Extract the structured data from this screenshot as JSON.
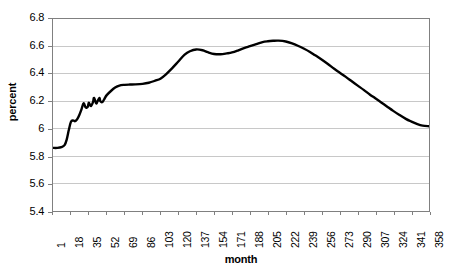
{
  "chart_data": {
    "type": "line",
    "title": "",
    "xlabel": "month",
    "ylabel": "percent",
    "xlim": [
      1,
      358
    ],
    "ylim": [
      5.4,
      6.8
    ],
    "grid": true,
    "legend": null,
    "y_ticks": [
      "6.8",
      "6.6",
      "6.4",
      "6.2",
      "6",
      "5.8",
      "5.6",
      "5.4"
    ],
    "y_tick_values": [
      6.8,
      6.6,
      6.4,
      6.2,
      6.0,
      5.8,
      5.6,
      5.4
    ],
    "x_ticks": [
      "1",
      "18",
      "35",
      "52",
      "69",
      "86",
      "103",
      "120",
      "137",
      "154",
      "171",
      "188",
      "205",
      "222",
      "239",
      "256",
      "273",
      "290",
      "307",
      "324",
      "341",
      "358"
    ],
    "x_tick_values": [
      1,
      18,
      35,
      52,
      69,
      86,
      103,
      120,
      137,
      154,
      171,
      188,
      205,
      222,
      239,
      256,
      273,
      290,
      307,
      324,
      341,
      358
    ],
    "series": [
      {
        "name": "percent",
        "color": "#000000",
        "line_width": 2.4,
        "x": [
          1,
          5,
          9,
          12,
          14,
          16,
          18,
          20,
          22,
          24,
          26,
          28,
          30,
          32,
          34,
          35,
          37,
          39,
          40,
          42,
          43,
          45,
          46,
          48,
          50,
          52,
          56,
          60,
          64,
          69,
          74,
          79,
          86,
          92,
          98,
          103,
          108,
          114,
          120,
          126,
          131,
          137,
          143,
          148,
          154,
          160,
          166,
          171,
          177,
          183,
          188,
          194,
          200,
          205,
          210,
          215,
          222,
          228,
          234,
          239,
          245,
          250,
          256,
          262,
          268,
          273,
          279,
          285,
          290,
          296,
          302,
          307,
          313,
          319,
          324,
          330,
          336,
          341,
          347,
          352,
          358
        ],
        "y": [
          5.86,
          5.86,
          5.865,
          5.88,
          5.92,
          5.99,
          6.05,
          6.06,
          6.055,
          6.07,
          6.1,
          6.14,
          6.185,
          6.155,
          6.16,
          6.19,
          6.165,
          6.195,
          6.225,
          6.185,
          6.195,
          6.225,
          6.2,
          6.195,
          6.22,
          6.245,
          6.275,
          6.3,
          6.315,
          6.32,
          6.322,
          6.323,
          6.327,
          6.335,
          6.35,
          6.365,
          6.395,
          6.44,
          6.49,
          6.54,
          6.565,
          6.578,
          6.572,
          6.558,
          6.545,
          6.543,
          6.549,
          6.556,
          6.572,
          6.59,
          6.602,
          6.617,
          6.632,
          6.638,
          6.641,
          6.642,
          6.636,
          6.622,
          6.603,
          6.585,
          6.56,
          6.535,
          6.505,
          6.472,
          6.437,
          6.41,
          6.378,
          6.344,
          6.316,
          6.283,
          6.248,
          6.222,
          6.19,
          6.157,
          6.13,
          6.1,
          6.072,
          6.053,
          6.033,
          6.022,
          6.018
        ]
      }
    ]
  },
  "axes": {
    "y_title": "percent",
    "x_title": "month"
  },
  "style": {
    "line_color": "#000000",
    "grid_color": "#c8c8c8",
    "frame_color": "#808080",
    "background": "#ffffff"
  }
}
